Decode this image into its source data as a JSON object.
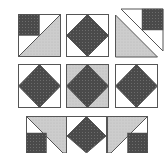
{
  "diagram": {
    "colors": {
      "background": "#ffffff",
      "dark_fabric": "#4a4a4a",
      "light_fabric": "#c8c8c8",
      "white_fabric": "#ffffff",
      "outline": "#555555"
    },
    "rows": [
      {
        "blocks": [
          {
            "type": "corner-square-half-triangle",
            "label": "Block 1"
          },
          {
            "type": "square-in-square",
            "label": "Block 2"
          },
          {
            "type": "split-triangle-with-square",
            "label": "Block 3"
          }
        ]
      },
      {
        "blocks": [
          {
            "type": "square-in-square",
            "label": "Block 4"
          },
          {
            "type": "square-in-square-light-corners",
            "label": "Block 5"
          },
          {
            "type": "square-in-square",
            "label": "Block 6"
          }
        ]
      },
      {
        "blocks": [
          {
            "type": "triangle-with-corner-square-left",
            "label": "Block 7"
          },
          {
            "type": "diamond-half",
            "label": "Block 8"
          },
          {
            "type": "triangle-with-corner-square-right",
            "label": "Block 9"
          }
        ]
      }
    ]
  }
}
